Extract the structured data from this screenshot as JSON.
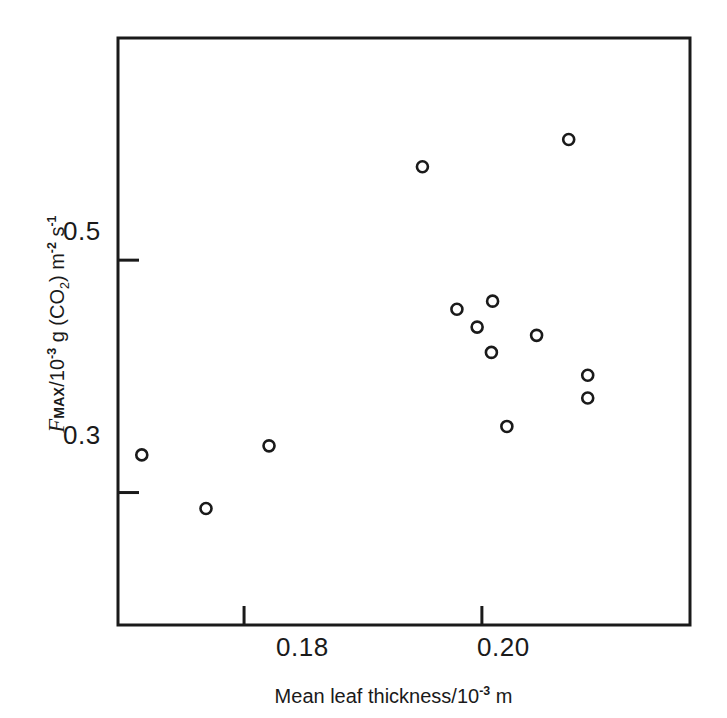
{
  "chart_data": {
    "type": "scatter",
    "title": "",
    "xlabel": "Mean leaf thickness/10^-3 m",
    "ylabel": "F_MAX / 10^-3 g (CO2) m^-2 s^-1",
    "xlabel_parts": {
      "prefix": "Mean leaf thickness/10",
      "exponent": "-3",
      "suffix": " m"
    },
    "ylabel_parts": {
      "symbol": "F",
      "subscript": "MAX",
      "mid": "/10",
      "exp1": "-3",
      "gas": " g (CO",
      "gas_sub": "2",
      "gas_close": ") m",
      "exp2": "-2",
      "unit_s": " s",
      "exp3": "-1"
    },
    "xticks": [
      0.18,
      0.2
    ],
    "xtick_labels": [
      "0.18",
      "0.20"
    ],
    "yticks": [
      0.3,
      0.5
    ],
    "ytick_labels": [
      "0.3",
      "0.5"
    ],
    "xlim": [
      0.1694,
      0.2175
    ],
    "ylim": [
      0.186,
      0.6912
    ],
    "grid": false,
    "legend": null,
    "marker": "open-circle",
    "marker_color": "#1a1a1a",
    "marker_size": 11,
    "n_points": 13,
    "points": [
      {
        "x": 0.1714,
        "y": 0.3324
      },
      {
        "x": 0.1768,
        "y": 0.2863
      },
      {
        "x": 0.1821,
        "y": 0.3402
      },
      {
        "x": 0.195,
        "y": 0.5804
      },
      {
        "x": 0.1979,
        "y": 0.4578
      },
      {
        "x": 0.1996,
        "y": 0.4424
      },
      {
        "x": 0.2009,
        "y": 0.4647
      },
      {
        "x": 0.2008,
        "y": 0.4206
      },
      {
        "x": 0.2021,
        "y": 0.3569
      },
      {
        "x": 0.2046,
        "y": 0.4353
      },
      {
        "x": 0.2073,
        "y": 0.6039
      },
      {
        "x": 0.2089,
        "y": 0.401
      },
      {
        "x": 0.2089,
        "y": 0.3814
      }
    ]
  },
  "axes": {
    "frame_color": "#1a1a1a",
    "frame_width": 3,
    "background": "#ffffff"
  }
}
